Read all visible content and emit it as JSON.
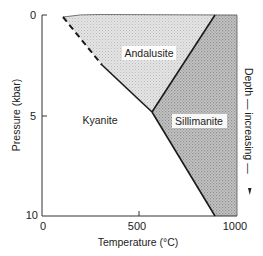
{
  "diagram": {
    "type": "phase-diagram",
    "x_axis": {
      "label": "Temperature (°C)",
      "ticks": [
        "0",
        "500",
        "1000"
      ],
      "range": [
        0,
        1000
      ]
    },
    "y_axis": {
      "label": "Pressure (kbar)",
      "ticks": [
        "0",
        "5",
        "10"
      ],
      "range": [
        0,
        10
      ],
      "inverted": true
    },
    "right_annotation": {
      "text": "Depth — increasing —",
      "arrow": "down-arrow"
    },
    "phases": [
      {
        "name": "Andalusite",
        "fill": "#d9d9d9"
      },
      {
        "name": "Kyanite",
        "fill": "#ffffff"
      },
      {
        "name": "Sillimanite",
        "fill": "#b8b8b8"
      }
    ],
    "triple_point": {
      "temperature_c": 567,
      "pressure_kbar": 4.8
    },
    "boundaries": [
      {
        "between": "Kyanite-Andalusite",
        "style": "dashed then solid",
        "from": [
          110,
          0
        ],
        "to": [
          567,
          4.8
        ]
      },
      {
        "between": "Andalusite-Sillimanite",
        "style": "solid",
        "from": [
          567,
          4.8
        ],
        "to": [
          887,
          0
        ]
      },
      {
        "between": "Kyanite-Sillimanite",
        "style": "solid",
        "from": [
          567,
          4.8
        ],
        "to": [
          887,
          10
        ]
      }
    ]
  }
}
